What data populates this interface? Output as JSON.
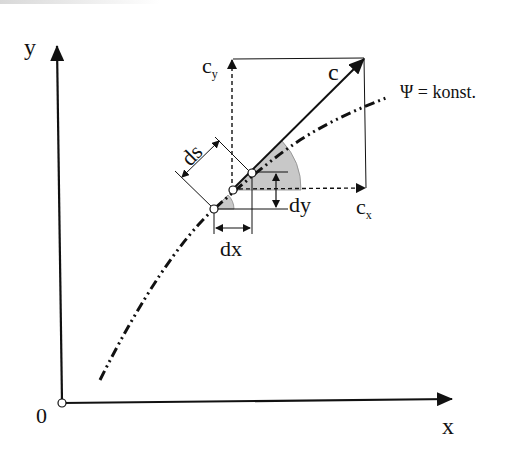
{
  "diagram": {
    "axes": {
      "x_label": "x",
      "y_label": "y",
      "origin_label": "0"
    },
    "curve": {
      "label": "Ψ = konst.",
      "style": "dash-dot-dot"
    },
    "vectors": {
      "c_label": "c",
      "cx_label": "c",
      "cx_sub": "x",
      "cy_label": "c",
      "cy_sub": "y"
    },
    "dimensions": {
      "ds_label": "ds",
      "dx_label": "dx",
      "dy_label": "dy"
    },
    "colors": {
      "line": "#111111",
      "angle_fill": "#c8c8c8",
      "point_fill": "#ffffff"
    }
  }
}
